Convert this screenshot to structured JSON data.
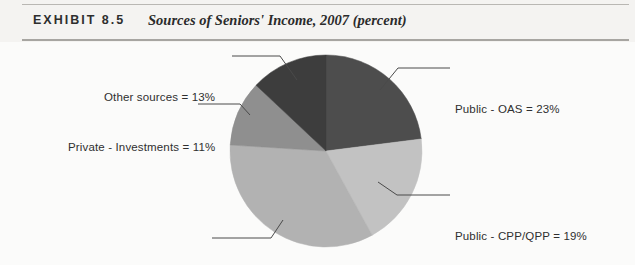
{
  "header": {
    "exhibit_label": "EXHIBIT 8.5",
    "title": "Sources of Seniors' Income, 2007 (percent)"
  },
  "chart_data": {
    "type": "pie",
    "title": "Sources of Seniors' Income, 2007 (percent)",
    "unit": "percent",
    "legend_position": "callout-labels",
    "start_angle_deg": 0,
    "direction": "clockwise",
    "categories": [
      "Public - OAS",
      "Public - CPP/QPP",
      "Private - Pensions & RRSPs",
      "Private - Investments",
      "Other sources"
    ],
    "values": [
      23,
      19,
      34,
      11,
      13
    ],
    "colors": [
      "#4d4d4d",
      "#c2c2c2",
      "#b2b2b2",
      "#8f8f8f",
      "#3d3d3d"
    ],
    "labels": [
      "Public - OAS = 23%",
      "Public - CPP/QPP = 19%",
      "Private - Pensions & RRSPs = 34%",
      "Private - Investments = 11%",
      "Other sources = 13%"
    ],
    "slices": [
      {
        "name": "Public - OAS",
        "value": 23,
        "label": "Public - OAS = 23%",
        "color": "#4d4d4d"
      },
      {
        "name": "Public - CPP/QPP",
        "value": 19,
        "label": "Public - CPP/QPP = 19%",
        "color": "#c2c2c2"
      },
      {
        "name": "Private - Pensions & RRSPs",
        "value": 34,
        "label": "Private - Pensions & RRSPs = 34%",
        "color": "#b2b2b2"
      },
      {
        "name": "Private - Investments",
        "value": 11,
        "label": "Private - Investments = 11%",
        "color": "#8f8f8f"
      },
      {
        "name": "Other sources",
        "value": 13,
        "label": "Other sources = 13%",
        "color": "#3d3d3d"
      }
    ]
  }
}
